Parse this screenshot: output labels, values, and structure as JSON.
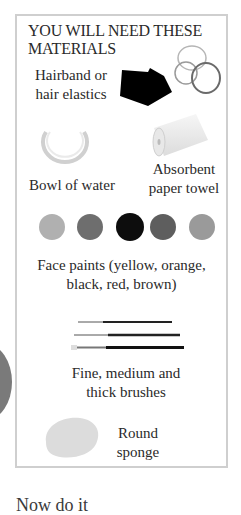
{
  "panel": {
    "title_line1": "YOU WILL NEED THESE",
    "title_line2": "MATERIALS",
    "items": [
      {
        "icon": "hairband-icon",
        "label_line1": "Hairband or",
        "label_line2": "hair elastics"
      },
      {
        "icon": "bowl-icon",
        "label": "Bowl of water"
      },
      {
        "icon": "paper-towel-icon",
        "label_line1": "Absorbent",
        "label_line2": "paper towel"
      },
      {
        "icon": "face-paints-icon",
        "label_line1": "Face paints (yellow, orange,",
        "label_line2": "black, red, brown)"
      },
      {
        "icon": "brushes-icon",
        "label_line1": "Fine, medium and",
        "label_line2": "thick brushes"
      },
      {
        "icon": "sponge-icon",
        "label_line1": "Round",
        "label_line2": "sponge"
      }
    ],
    "paint_colors": [
      "#b0b0b0",
      "#6e6e6e",
      "#0d0d0d",
      "#5e5e5e",
      "#9a9a9a"
    ]
  },
  "footer": {
    "partial_text": "Now do it"
  }
}
